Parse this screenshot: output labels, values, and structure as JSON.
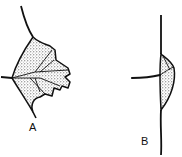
{
  "figure": {
    "panels": [
      {
        "id": "A",
        "label": "A",
        "description": "lobed leaf blade with stippled shading and veins"
      },
      {
        "id": "B",
        "label": "B",
        "description": "stem with lateral shaded sheath-like lobe and side branch"
      }
    ],
    "colors": {
      "ink": "#111111",
      "background": "#ffffff"
    }
  }
}
